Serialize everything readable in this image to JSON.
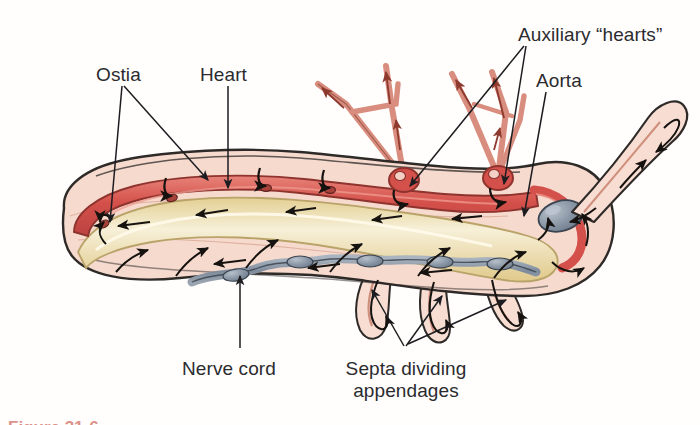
{
  "figure": {
    "domain": "biology-anatomy-diagram",
    "background_color": "#fffefd",
    "caption_partial": "Figure 31-6",
    "caption_color": "#c0392b"
  },
  "labels": [
    {
      "id": "ostia",
      "text": "Ostia",
      "x": 96,
      "y": 64,
      "align": "left"
    },
    {
      "id": "heart",
      "text": "Heart",
      "x": 200,
      "y": 64,
      "align": "left"
    },
    {
      "id": "auxiliary-hearts",
      "text": "Auxiliary “hearts”",
      "x": 518,
      "y": 24,
      "align": "left"
    },
    {
      "id": "aorta",
      "text": "Aorta",
      "x": 536,
      "y": 70,
      "align": "left"
    },
    {
      "id": "nerve-cord",
      "text": "Nerve cord",
      "x": 182,
      "y": 358,
      "align": "left"
    },
    {
      "id": "septa",
      "text": "Septa dividing\nappendages",
      "x": 360,
      "y": 358,
      "align": "center"
    }
  ],
  "anatomy": {
    "parts": [
      {
        "name": "body-wall",
        "label": "Body wall / hemocoel",
        "color": "#f6dace",
        "outline": "#2e2a28"
      },
      {
        "name": "heart-tube",
        "label": "Dorsal heart tube",
        "color": "#d9564f",
        "outline": "#8e332e"
      },
      {
        "name": "gut",
        "label": "Gut",
        "color": "#ead9a2",
        "outline": "#b9a369"
      },
      {
        "name": "nerve-cord",
        "label": "Ventral nerve cord",
        "color": "#8c99a8",
        "outline": "#3b4450"
      },
      {
        "name": "brain-ganglion",
        "label": "Cerebral ganglion",
        "color": "#8c99a8",
        "outline": "#3b4450"
      },
      {
        "name": "dorsal-vessels",
        "label": "Dorsal gill vessels",
        "color": "#e09a8d",
        "outline": "#9c5346"
      },
      {
        "name": "auxiliary-heart",
        "label": "Auxiliary heart bulb",
        "color": "#d9564f",
        "outline": "#8e332e"
      },
      {
        "name": "appendage",
        "label": "Ventral appendage",
        "color": "#f7ddd2",
        "outline": "#2e2a28"
      },
      {
        "name": "antenna",
        "label": "Antenna",
        "color": "#f7ddd2",
        "outline": "#2e2a28"
      },
      {
        "name": "flow-arrow",
        "label": "Hemolymph flow arrow",
        "color": "#15120f",
        "outline": "#15120f"
      },
      {
        "name": "ostium",
        "label": "Ostium (valved slit)",
        "color": "#a8433c",
        "outline": "#5e211d"
      }
    ],
    "counts": {
      "ostia": 4,
      "auxiliary_hearts": 2,
      "ventral_appendages": 3,
      "dorsal_gill_vessels": 5
    }
  }
}
